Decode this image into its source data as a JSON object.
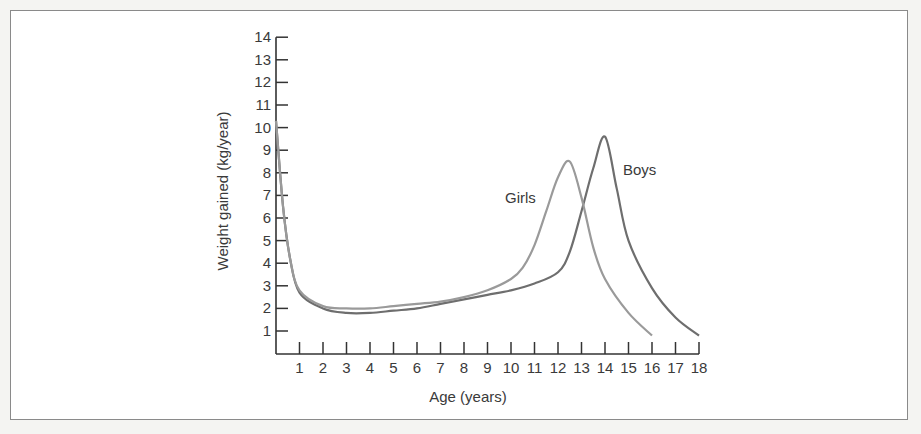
{
  "chart_data": {
    "type": "line",
    "title": "",
    "xlabel": "Age (years)",
    "ylabel": "Weight gained (kg/year)",
    "xlim": [
      0,
      18
    ],
    "ylim": [
      0,
      14
    ],
    "x_ticks": [
      1,
      2,
      3,
      4,
      5,
      6,
      7,
      8,
      9,
      10,
      11,
      12,
      13,
      14,
      15,
      16,
      17,
      18
    ],
    "y_ticks": [
      1,
      2,
      3,
      4,
      5,
      6,
      7,
      8,
      9,
      10,
      11,
      12,
      13,
      14
    ],
    "grid": false,
    "legend": "inline labels near peaks",
    "series": [
      {
        "name": "Boys",
        "color": "#6e6e6e",
        "points": [
          [
            0,
            10.3
          ],
          [
            0.3,
            6.5
          ],
          [
            0.6,
            4.2
          ],
          [
            1,
            2.7
          ],
          [
            2,
            2.0
          ],
          [
            3,
            1.8
          ],
          [
            4,
            1.8
          ],
          [
            5,
            1.9
          ],
          [
            6,
            2.0
          ],
          [
            7,
            2.2
          ],
          [
            8,
            2.4
          ],
          [
            9,
            2.6
          ],
          [
            10,
            2.8
          ],
          [
            11,
            3.1
          ],
          [
            12,
            3.6
          ],
          [
            12.5,
            4.5
          ],
          [
            13,
            6.3
          ],
          [
            13.5,
            8.2
          ],
          [
            14,
            9.6
          ],
          [
            14.5,
            7.3
          ],
          [
            15,
            5.0
          ],
          [
            16,
            2.9
          ],
          [
            17,
            1.6
          ],
          [
            18,
            0.8
          ]
        ]
      },
      {
        "name": "Girls",
        "color": "#9a9a9a",
        "points": [
          [
            0,
            10.3
          ],
          [
            0.3,
            6.5
          ],
          [
            0.6,
            4.2
          ],
          [
            1,
            2.8
          ],
          [
            2,
            2.1
          ],
          [
            3,
            2.0
          ],
          [
            4,
            2.0
          ],
          [
            5,
            2.1
          ],
          [
            6,
            2.2
          ],
          [
            7,
            2.3
          ],
          [
            8,
            2.5
          ],
          [
            9,
            2.8
          ],
          [
            10,
            3.3
          ],
          [
            10.5,
            3.8
          ],
          [
            11,
            4.8
          ],
          [
            11.5,
            6.3
          ],
          [
            12,
            7.8
          ],
          [
            12.5,
            8.5
          ],
          [
            13,
            6.9
          ],
          [
            13.5,
            4.7
          ],
          [
            14,
            3.3
          ],
          [
            15,
            1.8
          ],
          [
            16,
            0.8
          ]
        ]
      }
    ]
  }
}
